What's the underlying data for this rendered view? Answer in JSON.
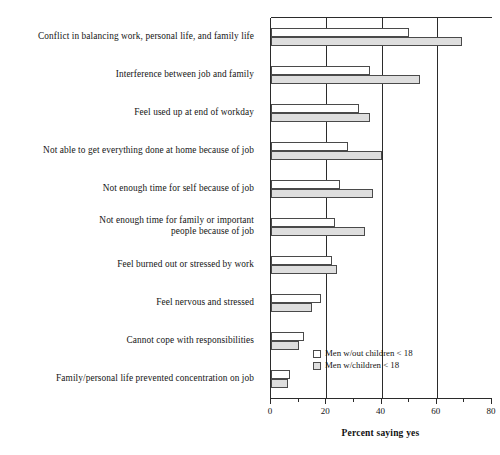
{
  "chart_data": {
    "type": "bar",
    "orientation": "horizontal",
    "title": "",
    "xlabel": "Percent saying yes",
    "ylabel": "",
    "xlim": [
      0,
      80
    ],
    "xticks": [
      0,
      20,
      40,
      60,
      80
    ],
    "xtick_labels": [
      "0",
      "20",
      "40",
      "60",
      "80"
    ],
    "minor_xticks": [
      10,
      30,
      50,
      70
    ],
    "grid": "vertical gridlines at 20, 40, 60",
    "legend_position": "inside lower-right of plot area",
    "categories": [
      "Conflict in balancing work, personal life, and family life",
      "Interference between job and family",
      "Feel used up at end of workday",
      "Not able to get everything done at home because of job",
      "Not enough time for self because of job",
      "Not enough time for family or important\npeople because of job",
      "Feel burned out or stressed by work",
      "Feel nervous and stressed",
      "Cannot cope with responsibilities",
      "Family/personal life prevented concentration on job"
    ],
    "series": [
      {
        "name": "Men w/out children < 18",
        "color": "#ffffff",
        "values": [
          50,
          36,
          32,
          28,
          25,
          23,
          22,
          18,
          12,
          7
        ]
      },
      {
        "name": "Men w/children < 18",
        "color": "#dedede",
        "values": [
          69,
          54,
          36,
          40,
          37,
          34,
          24,
          15,
          10,
          6
        ]
      }
    ]
  }
}
